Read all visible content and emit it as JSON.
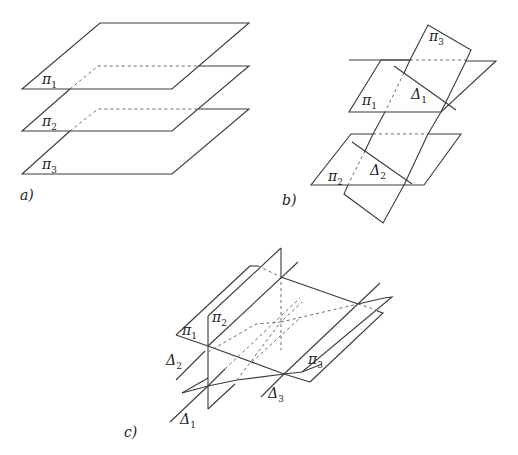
{
  "figure": {
    "panels": [
      {
        "id": "a",
        "caption": "a)",
        "description": "Three parallel planes",
        "labels": [
          {
            "sym": "π",
            "sub": "1"
          },
          {
            "sym": "π",
            "sub": "2"
          },
          {
            "sym": "π",
            "sub": "3"
          }
        ]
      },
      {
        "id": "b",
        "caption": "b)",
        "description": "Two parallel planes cut by a third plane along parallel lines",
        "labels": [
          {
            "sym": "π",
            "sub": "3"
          },
          {
            "sym": "π",
            "sub": "1"
          },
          {
            "sym": "Δ",
            "sub": "1"
          },
          {
            "sym": "π",
            "sub": "2"
          },
          {
            "sym": "Δ",
            "sub": "2"
          }
        ]
      },
      {
        "id": "c",
        "caption": "c)",
        "description": "Three planes intersecting pairwise along parallel lines",
        "labels": [
          {
            "sym": "π",
            "sub": "1"
          },
          {
            "sym": "π",
            "sub": "2"
          },
          {
            "sym": "Δ",
            "sub": "2"
          },
          {
            "sym": "π",
            "sub": "3"
          },
          {
            "sym": "Δ",
            "sub": "3"
          },
          {
            "sym": "Δ",
            "sub": "1"
          }
        ]
      }
    ]
  }
}
